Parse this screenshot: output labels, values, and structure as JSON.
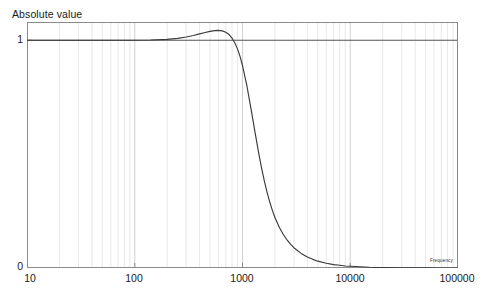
{
  "chart_data": {
    "type": "line",
    "title": "Absolute value",
    "xlabel": "Frequency",
    "ylabel": "",
    "xscale": "log",
    "yscale": "linear",
    "xlim": [
      10,
      100000
    ],
    "ylim": [
      0,
      1.08
    ],
    "grid": true,
    "grid_minor": true,
    "legend": "none",
    "xticks": [
      {
        "value": 10,
        "label": "10"
      },
      {
        "value": 100,
        "label": "100"
      },
      {
        "value": 1000,
        "label": "1000"
      },
      {
        "value": 10000,
        "label": "10000"
      },
      {
        "value": 100000,
        "label": "100000"
      }
    ],
    "yticks": [
      {
        "value": 0,
        "label": "0"
      },
      {
        "value": 1,
        "label": "1"
      }
    ],
    "reference_lines": [
      {
        "axis": "y",
        "value": 1,
        "color": "#4d4d4d"
      }
    ],
    "series": [
      {
        "name": "Absolute value",
        "color": "#3a3a3a",
        "points": [
          {
            "x": 10,
            "y": 1.0
          },
          {
            "x": 14,
            "y": 1.0
          },
          {
            "x": 20,
            "y": 1.0
          },
          {
            "x": 30,
            "y": 1.0
          },
          {
            "x": 40,
            "y": 1.0
          },
          {
            "x": 60,
            "y": 1.0
          },
          {
            "x": 80,
            "y": 1.0
          },
          {
            "x": 100,
            "y": 1.0
          },
          {
            "x": 140,
            "y": 1.001
          },
          {
            "x": 200,
            "y": 1.004
          },
          {
            "x": 250,
            "y": 1.008
          },
          {
            "x": 300,
            "y": 1.014
          },
          {
            "x": 350,
            "y": 1.021
          },
          {
            "x": 400,
            "y": 1.028
          },
          {
            "x": 450,
            "y": 1.034
          },
          {
            "x": 500,
            "y": 1.039
          },
          {
            "x": 550,
            "y": 1.042
          },
          {
            "x": 600,
            "y": 1.043
          },
          {
            "x": 650,
            "y": 1.041
          },
          {
            "x": 700,
            "y": 1.035
          },
          {
            "x": 750,
            "y": 1.025
          },
          {
            "x": 800,
            "y": 1.009
          },
          {
            "x": 850,
            "y": 0.988
          },
          {
            "x": 900,
            "y": 0.961
          },
          {
            "x": 950,
            "y": 0.928
          },
          {
            "x": 1000,
            "y": 0.889
          },
          {
            "x": 1100,
            "y": 0.798
          },
          {
            "x": 1200,
            "y": 0.699
          },
          {
            "x": 1300,
            "y": 0.602
          },
          {
            "x": 1400,
            "y": 0.515
          },
          {
            "x": 1500,
            "y": 0.441
          },
          {
            "x": 1600,
            "y": 0.379
          },
          {
            "x": 1700,
            "y": 0.328
          },
          {
            "x": 1800,
            "y": 0.286
          },
          {
            "x": 1900,
            "y": 0.251
          },
          {
            "x": 2000,
            "y": 0.222
          },
          {
            "x": 2200,
            "y": 0.178
          },
          {
            "x": 2400,
            "y": 0.146
          },
          {
            "x": 2600,
            "y": 0.122
          },
          {
            "x": 2800,
            "y": 0.104
          },
          {
            "x": 3000,
            "y": 0.089
          },
          {
            "x": 3500,
            "y": 0.064
          },
          {
            "x": 4000,
            "y": 0.048
          },
          {
            "x": 4500,
            "y": 0.038
          },
          {
            "x": 5000,
            "y": 0.03
          },
          {
            "x": 6000,
            "y": 0.021
          },
          {
            "x": 7000,
            "y": 0.015
          },
          {
            "x": 8000,
            "y": 0.012
          },
          {
            "x": 9000,
            "y": 0.009
          },
          {
            "x": 10000,
            "y": 0.0075
          },
          {
            "x": 15000,
            "y": 0.0033
          },
          {
            "x": 20000,
            "y": 0.0019
          },
          {
            "x": 30000,
            "y": 0.0008
          },
          {
            "x": 50000,
            "y": 0.0003
          },
          {
            "x": 70000,
            "y": 0.00015
          },
          {
            "x": 100000,
            "y": 8e-05
          }
        ]
      }
    ]
  },
  "style": {
    "frame_color": "#8a8a8a",
    "gridline_color": "#c9c9c9",
    "minor_gridline_color": "#d8d8d8",
    "background": "#ffffff"
  }
}
